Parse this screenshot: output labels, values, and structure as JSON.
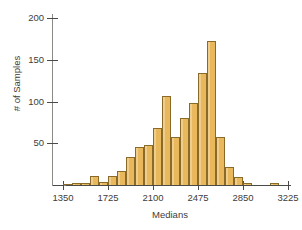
{
  "chart_data": {
    "type": "bar",
    "title": "",
    "subtitle": "",
    "xlabel": "Medians",
    "ylabel": "# of Samples",
    "xlim": [
      1275,
      3300
    ],
    "ylim": [
      0,
      210
    ],
    "bin_width": 75,
    "grid": false,
    "legend": null,
    "x_ticks": [
      1350,
      1725,
      2100,
      2475,
      2850,
      3225
    ],
    "x_tick_labels": [
      "1350",
      "1725",
      "2100",
      "2475",
      "2850",
      "3225"
    ],
    "y_ticks": [
      50,
      100,
      150,
      200
    ],
    "y_tick_labels": [
      "50",
      "100",
      "150",
      "200"
    ],
    "bar_color": "#e9b85c",
    "bar_edge_color": "#8a6a28",
    "axis_color": "#4a4a48",
    "background_color": "#ffffff",
    "bin_starts": [
      1350,
      1425,
      1500,
      1575,
      1650,
      1725,
      1800,
      1875,
      1950,
      2025,
      2100,
      2175,
      2250,
      2325,
      2400,
      2475,
      2550,
      2625,
      2700,
      2775,
      2850,
      2925,
      3000,
      3075
    ],
    "categories": [
      "1350-1425",
      "1425-1500",
      "1500-1575",
      "1575-1650",
      "1650-1725",
      "1725-1800",
      "1800-1875",
      "1875-1950",
      "1950-2025",
      "2025-2100",
      "2100-2175",
      "2175-2250",
      "2250-2325",
      "2325-2400",
      "2400-2475",
      "2475-2550",
      "2550-2625",
      "2625-2700",
      "2700-2775",
      "2775-2850",
      "2850-2925",
      "2925-3000",
      "3000-3075",
      "3075-3150"
    ],
    "values": [
      1,
      2,
      3,
      11,
      4,
      11,
      17,
      34,
      45,
      48,
      68,
      107,
      58,
      80,
      98,
      134,
      172,
      57,
      21,
      10,
      2,
      0,
      0,
      2
    ]
  }
}
